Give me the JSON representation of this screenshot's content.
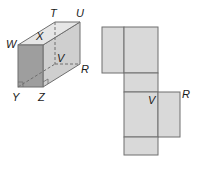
{
  "figure": {
    "prism": {
      "vertex_labels": {
        "T": "T",
        "U": "U",
        "W": "W",
        "X": "X",
        "V": "V",
        "R": "R",
        "Y": "Y",
        "Z": "Z"
      },
      "right_angle_marks": [
        "Y",
        "Z"
      ]
    },
    "net": {
      "labels": {
        "V": "V",
        "R": "R"
      }
    },
    "colors": {
      "face_fill": "#d9d9d9",
      "front_face_fill": "#9e9e9e",
      "top_face_fill": "#e6e6e6",
      "edge_color": "#6f6f6f",
      "label_color": "#1a1a1a"
    }
  }
}
